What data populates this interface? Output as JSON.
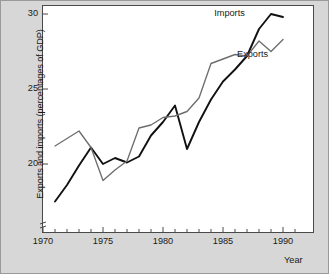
{
  "chart_data": {
    "type": "line",
    "title": "",
    "xlabel": "Year",
    "ylabel": "Exports and imports (percentages of GDP)",
    "xlim": [
      1970,
      1991
    ],
    "ylim": [
      17,
      30.7
    ],
    "y_axis_break": true,
    "grid": false,
    "legend_position": "inline-annotation",
    "x_major_ticks": [
      1970,
      1975,
      1980,
      1985,
      1990
    ],
    "x_major_tick_labels": [
      "1970",
      "1975",
      "1980",
      "1985",
      "1990"
    ],
    "x_minor_tick_interval": 1,
    "y_major_ticks": [
      20,
      25,
      30
    ],
    "y_major_tick_labels": [
      "20",
      "25",
      "30"
    ],
    "x": [
      1971,
      1972,
      1973,
      1974,
      1975,
      1976,
      1977,
      1978,
      1979,
      1980,
      1981,
      1982,
      1983,
      1984,
      1985,
      1986,
      1987,
      1988,
      1989,
      1990
    ],
    "series": [
      {
        "name": "Imports",
        "color": "#111111",
        "label_x": 1986.1,
        "label_y": 30.0,
        "values": [
          17.5,
          18.6,
          19.9,
          21.1,
          20.0,
          20.4,
          20.1,
          20.5,
          21.9,
          22.8,
          23.9,
          21.0,
          22.8,
          24.3,
          25.5,
          26.3,
          27.2,
          29.0,
          30.0,
          29.8
        ]
      },
      {
        "name": "Exports",
        "color": "#6e6e6e",
        "label_x": 1988.0,
        "label_y": 27.3,
        "values": [
          21.2,
          21.7,
          22.2,
          21.1,
          18.9,
          19.6,
          20.2,
          22.4,
          22.6,
          23.1,
          23.2,
          23.5,
          24.4,
          26.7,
          27.0,
          27.3,
          27.2,
          28.2,
          27.5,
          28.3
        ]
      }
    ]
  },
  "axes": {
    "y_title": "Exports and imports (percentages of GDP)",
    "x_title": "Year"
  }
}
